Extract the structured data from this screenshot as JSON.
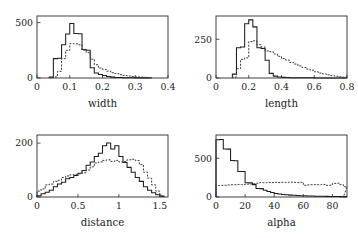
{
  "figure": {
    "background": "#ffffff",
    "line_colors": {
      "solid_series": "#1d1d1d",
      "dashed_series": "#3a3a3a",
      "axis": "#2b2b2b"
    },
    "layout": "2x2 grid of histogram panels"
  },
  "chart_data": [
    {
      "type": "bar",
      "panel": "top-left",
      "title": "",
      "xlabel": "width",
      "ylabel": "",
      "xlim": [
        0,
        0.4
      ],
      "ylim": [
        0,
        560
      ],
      "xticks": [
        0,
        0.1,
        0.2,
        0.3,
        0.4
      ],
      "xticklabels": [
        "0",
        "0.1",
        "0.2",
        "0.3",
        "0.4"
      ],
      "yticks": [
        0,
        500
      ],
      "yticklabels": [
        "0",
        "500"
      ],
      "grid": false,
      "legend": "none",
      "bin_width": 0.0125,
      "bin_edges": [
        0.0375,
        0.05,
        0.0625,
        0.075,
        0.0875,
        0.1,
        0.1125,
        0.125,
        0.1375,
        0.15,
        0.1625,
        0.175,
        0.1875,
        0.2,
        0.2125,
        0.225,
        0.2375,
        0.25,
        0.2625,
        0.275,
        0.2875,
        0.3,
        0.3125,
        0.325,
        0.3375,
        0.35
      ],
      "series": [
        {
          "name": "solid",
          "style": "solid",
          "values": [
            8,
            175,
            178,
            300,
            398,
            492,
            402,
            400,
            258,
            250,
            92,
            45,
            32,
            22,
            14,
            8,
            5,
            4,
            3,
            2,
            2,
            1,
            1,
            1,
            0
          ]
        },
        {
          "name": "dashed",
          "style": "dashed",
          "values": [
            2,
            10,
            60,
            175,
            250,
            310,
            308,
            300,
            252,
            230,
            170,
            120,
            90,
            78,
            62,
            48,
            40,
            30,
            22,
            18,
            14,
            10,
            8,
            6,
            4
          ]
        }
      ]
    },
    {
      "type": "bar",
      "panel": "top-right",
      "title": "",
      "xlabel": "length",
      "ylabel": "",
      "xlim": [
        0,
        0.8
      ],
      "ylim": [
        0,
        400
      ],
      "xticks": [
        0,
        0.2,
        0.4,
        0.6,
        0.8
      ],
      "xticklabels": [
        "0",
        "0.2",
        "0.4",
        "0.6",
        "0.8"
      ],
      "yticks": [
        0,
        250
      ],
      "yticklabels": [
        "0",
        "250"
      ],
      "grid": false,
      "legend": "none",
      "bin_width": 0.025,
      "bin_edges": [
        0.1,
        0.125,
        0.15,
        0.175,
        0.2,
        0.225,
        0.25,
        0.275,
        0.3,
        0.325,
        0.35,
        0.375,
        0.4,
        0.425,
        0.45,
        0.475,
        0.5,
        0.525,
        0.55,
        0.575,
        0.6,
        0.625,
        0.65,
        0.675,
        0.7,
        0.725,
        0.75,
        0.775
      ],
      "values_note": "counts per bin",
      "series": [
        {
          "name": "solid",
          "style": "solid",
          "values": [
            25,
            195,
            200,
            350,
            375,
            330,
            195,
            190,
            115,
            30,
            12,
            6,
            4,
            3,
            2,
            2,
            1,
            1,
            1,
            1,
            0,
            0,
            0,
            0,
            0,
            0,
            0,
            0
          ]
        },
        {
          "name": "dashed",
          "style": "dashed",
          "values": [
            5,
            60,
            120,
            130,
            235,
            240,
            215,
            200,
            175,
            170,
            155,
            140,
            125,
            115,
            100,
            90,
            78,
            68,
            58,
            50,
            40,
            32,
            26,
            20,
            15,
            11,
            8,
            5
          ]
        }
      ]
    },
    {
      "type": "bar",
      "panel": "bottom-left",
      "title": "",
      "xlabel": "distance",
      "ylabel": "",
      "xlim": [
        0,
        1.6
      ],
      "ylim": [
        0,
        230
      ],
      "xticks": [
        0,
        0.5,
        1.0,
        1.5
      ],
      "xticklabels": [
        "0",
        "0.5",
        "1",
        "1.5"
      ],
      "yticks": [
        0,
        200
      ],
      "yticklabels": [
        "0",
        "200"
      ],
      "grid": false,
      "legend": "none",
      "bin_width": 0.05,
      "bin_edges": [
        0.0,
        0.05,
        0.1,
        0.15,
        0.2,
        0.25,
        0.3,
        0.35,
        0.4,
        0.45,
        0.5,
        0.55,
        0.6,
        0.65,
        0.7,
        0.75,
        0.8,
        0.85,
        0.9,
        0.95,
        1.0,
        1.05,
        1.1,
        1.15,
        1.2,
        1.25,
        1.3,
        1.35,
        1.4,
        1.45,
        1.5,
        1.55
      ],
      "series": [
        {
          "name": "solid",
          "style": "solid",
          "values": [
            5,
            12,
            18,
            25,
            38,
            48,
            55,
            68,
            72,
            80,
            88,
            98,
            118,
            130,
            150,
            162,
            190,
            200,
            178,
            190,
            150,
            128,
            110,
            92,
            72,
            58,
            38,
            25,
            16,
            8,
            3
          ]
        },
        {
          "name": "dashed",
          "style": "dashed",
          "values": [
            22,
            30,
            45,
            48,
            58,
            62,
            72,
            78,
            82,
            84,
            86,
            90,
            100,
            112,
            126,
            130,
            136,
            138,
            132,
            136,
            130,
            132,
            138,
            140,
            135,
            120,
            92,
            70,
            45,
            22,
            6
          ]
        }
      ]
    },
    {
      "type": "bar",
      "panel": "bottom-right",
      "title": "",
      "xlabel": "alpha",
      "ylabel": "",
      "xlim": [
        0,
        90
      ],
      "ylim": [
        0,
        800
      ],
      "xticks": [
        0,
        20,
        40,
        60,
        80
      ],
      "xticklabels": [
        "0",
        "20",
        "40",
        "60",
        "80"
      ],
      "yticks": [
        0,
        500
      ],
      "yticklabels": [
        "0",
        "500"
      ],
      "grid": false,
      "legend": "none",
      "bin_width": 2.5,
      "bin_edges": [
        0,
        2.5,
        5,
        7.5,
        10,
        12.5,
        15,
        17.5,
        20,
        22.5,
        25,
        27.5,
        30,
        32.5,
        35,
        37.5,
        40,
        42.5,
        45,
        47.5,
        50,
        52.5,
        55,
        57.5,
        60,
        62.5,
        65,
        67.5,
        70,
        72.5,
        75,
        77.5,
        80,
        82.5,
        85,
        87.5
      ],
      "series": [
        {
          "name": "solid",
          "style": "solid",
          "values": [
            740,
            742,
            620,
            618,
            470,
            468,
            330,
            328,
            185,
            182,
            160,
            110,
            108,
            88,
            72,
            58,
            44,
            38,
            32,
            28,
            24,
            22,
            19,
            17,
            15,
            14,
            12,
            11,
            10,
            9,
            8,
            7,
            6,
            6,
            5,
            5
          ]
        },
        {
          "name": "dashed",
          "style": "dashed",
          "values": [
            148,
            150,
            152,
            155,
            158,
            158,
            162,
            160,
            165,
            168,
            172,
            178,
            186,
            184,
            188,
            186,
            190,
            186,
            190,
            188,
            192,
            188,
            186,
            190,
            152,
            156,
            158,
            160,
            158,
            162,
            150,
            152,
            175,
            178,
            160,
            132
          ]
        }
      ]
    }
  ]
}
